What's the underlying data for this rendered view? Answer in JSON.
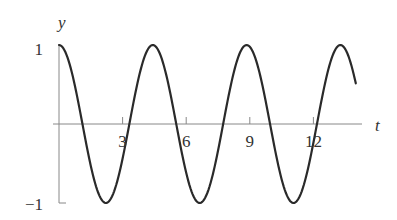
{
  "chart_data": {
    "type": "line",
    "title": "",
    "xlabel": "t",
    "ylabel": "y",
    "function": "y = cos(1.42 t)",
    "xlim": [
      0,
      14
    ],
    "ylim": [
      -1,
      1
    ],
    "x_ticks": [
      3,
      6,
      9,
      12
    ],
    "x_tick_labels": [
      "3",
      "6",
      "9",
      "12"
    ],
    "y_ticks": [
      1,
      -1
    ],
    "y_tick_labels": [
      "1",
      "−1"
    ],
    "grid": false,
    "legend": null,
    "series": [
      {
        "name": "y(t)",
        "omega": 1.42,
        "x": [
          0,
          1.1,
          2.21,
          3.32,
          4.42,
          5.53,
          6.64,
          7.74,
          8.85,
          9.96,
          11.06,
          12.17,
          13.27,
          14
        ],
        "values": [
          1,
          0,
          -1,
          0,
          1,
          0,
          -1,
          0,
          1,
          0,
          -1,
          0,
          1,
          0.51
        ]
      }
    ]
  },
  "colors": {
    "axis": "#888888",
    "curve": "#2a2a2a",
    "text": "#333333"
  }
}
